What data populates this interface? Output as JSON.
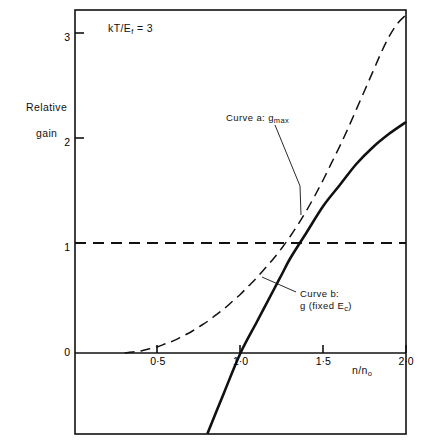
{
  "figure": {
    "annotation": "kT/E",
    "annotation_subscript": "f",
    "annotation_value": " = 3",
    "ylabel_line1": "Relative",
    "ylabel_line2": "gain",
    "xlabel": "n/n",
    "xlabel_subscript": "o"
  },
  "curve_a": {
    "label_prefix": "Curve a: g",
    "label_subscript": "max"
  },
  "curve_b": {
    "label_line1": "Curve b:",
    "label_line2_pre": "g (fixed E",
    "label_line2_sub": "c",
    "label_line2_post": ")"
  },
  "chart_data": {
    "type": "line",
    "title": "",
    "subtitle": "",
    "annotation": "kT/Ef = 3",
    "xlabel": "n/no",
    "ylabel": "Relative gain",
    "xlim": [
      0,
      2.0
    ],
    "ylim": [
      -0.78,
      3.23
    ],
    "grid": false,
    "legend_position": "inline-annotations",
    "xticks": [
      0.5,
      1.0,
      1.5,
      2.0
    ],
    "xticklabels": [
      "0·5",
      "1·0",
      "1·5",
      "2·0"
    ],
    "yticks": [
      0,
      1,
      2,
      3
    ],
    "yticklabels": [
      "0",
      "1",
      "2",
      "3"
    ],
    "reference_lines": [
      {
        "name": "unity-gain-line",
        "orientation": "horizontal",
        "y": 1.0,
        "style": "dashed",
        "x_from": 0.0,
        "x_to": 2.0
      }
    ],
    "series": [
      {
        "name": "Curve a: gmax",
        "style": "dashed",
        "x": [
          0.3,
          0.35,
          0.4,
          0.45,
          0.5,
          0.55,
          0.6,
          0.65,
          0.7,
          0.75,
          0.8,
          0.85,
          0.9,
          0.95,
          1.0,
          1.05,
          1.1,
          1.15,
          1.2,
          1.25,
          1.3,
          1.35,
          1.4,
          1.45,
          1.5,
          1.55,
          1.6,
          1.65,
          1.7,
          1.75,
          1.8,
          1.85,
          1.9,
          1.95,
          2.0
        ],
        "y": [
          0.0,
          0.01,
          0.02,
          0.04,
          0.06,
          0.09,
          0.12,
          0.16,
          0.2,
          0.25,
          0.3,
          0.36,
          0.42,
          0.49,
          0.56,
          0.64,
          0.72,
          0.81,
          0.9,
          1.0,
          1.11,
          1.23,
          1.36,
          1.5,
          1.65,
          1.81,
          1.97,
          2.14,
          2.32,
          2.5,
          2.68,
          2.86,
          3.02,
          3.14,
          3.22
        ]
      },
      {
        "name": "Curve b: g (fixed Ec)",
        "style": "solid",
        "x": [
          0.8,
          0.9,
          1.0,
          1.1,
          1.2,
          1.25,
          1.3,
          1.4,
          1.5,
          1.6,
          1.7,
          1.8,
          1.9,
          2.0
        ],
        "y": [
          -0.77,
          -0.38,
          0.0,
          0.3,
          0.6,
          0.75,
          0.9,
          1.15,
          1.4,
          1.6,
          1.8,
          1.96,
          2.09,
          2.2
        ]
      }
    ],
    "annotations": [
      {
        "name": "curve-a-callout",
        "text": "Curve a: gmax",
        "leader_from": [
          1.21,
          2.06
        ],
        "leader_to": [
          1.36,
          1.4
        ]
      },
      {
        "name": "curve-b-callout",
        "text": "Curve b: g (fixed Ec)",
        "leader_from": [
          1.36,
          0.57
        ],
        "leader_to": [
          1.13,
          0.73
        ]
      }
    ]
  }
}
